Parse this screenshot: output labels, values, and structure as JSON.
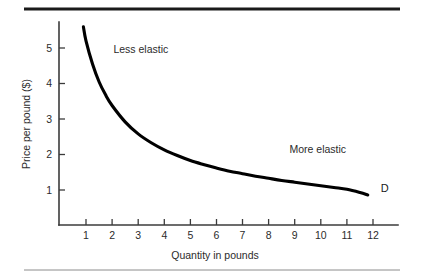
{
  "figure": {
    "background_color": "#ffffff",
    "width": 422,
    "height": 280,
    "top_rule_color": "#1a1a1a",
    "bottom_rule_color": "#8c8c8c"
  },
  "chart_data": {
    "type": "line",
    "title": "",
    "subtitle": "",
    "xlabel": "Quantity in pounds",
    "ylabel": "Price per pound ($)",
    "xlim": [
      0.3,
      12.8
    ],
    "ylim": [
      0.0,
      5.9
    ],
    "grid": false,
    "legend_position": "none",
    "xticks": [
      1,
      2,
      3,
      4,
      5,
      6,
      7,
      8,
      9,
      10,
      11,
      12
    ],
    "xtick_labels": [
      "1",
      "2",
      "3",
      "4",
      "5",
      "6",
      "7",
      "8",
      "9",
      "10",
      "11",
      "12"
    ],
    "yticks": [
      1,
      2,
      3,
      4,
      5
    ],
    "ytick_labels": [
      "1",
      "2",
      "3",
      "4",
      "5"
    ],
    "series": [
      {
        "name": "D",
        "label": "D",
        "color": "#000000",
        "x": [
          0.9,
          1.0,
          1.25,
          1.5,
          1.75,
          2.0,
          2.5,
          3.0,
          3.5,
          4.0,
          4.5,
          5.0,
          5.5,
          6.0,
          6.5,
          7.0,
          7.5,
          8.0,
          8.5,
          9.0,
          9.5,
          10.0,
          10.5,
          11.0,
          11.5,
          11.8
        ],
        "y": [
          5.6,
          5.2,
          4.55,
          4.05,
          3.68,
          3.38,
          2.92,
          2.58,
          2.33,
          2.13,
          1.97,
          1.83,
          1.72,
          1.62,
          1.53,
          1.46,
          1.39,
          1.33,
          1.27,
          1.22,
          1.17,
          1.12,
          1.07,
          1.02,
          0.93,
          0.86
        ]
      }
    ],
    "annotations": [
      {
        "text": "Less elastic",
        "x": 2.05,
        "y": 4.85
      },
      {
        "text": "More elastic",
        "x": 8.8,
        "y": 2.05
      },
      {
        "text": "D",
        "x": 12.3,
        "y": 0.93
      }
    ]
  }
}
